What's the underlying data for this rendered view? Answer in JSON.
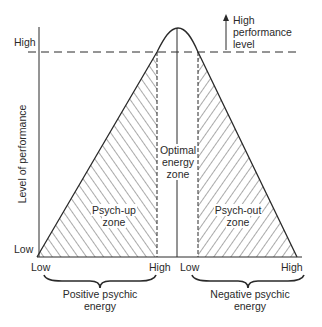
{
  "diagram": {
    "y_axis": {
      "title": "Level of performance",
      "high_label": "High",
      "low_label": "Low"
    },
    "performance_marker": {
      "label_line1": "High",
      "label_line2": "performance",
      "label_line3": "level"
    },
    "zones": {
      "psych_up": {
        "line1": "Psych-up",
        "line2": "zone"
      },
      "optimal": {
        "line1": "Optimal",
        "line2": "energy",
        "line3": "zone"
      },
      "psych_out": {
        "line1": "Psych-out",
        "line2": "zone"
      }
    },
    "x_axis": {
      "positive": {
        "low": "Low",
        "high": "High",
        "title_line1": "Positive psychic",
        "title_line2": "energy"
      },
      "negative": {
        "low": "Low",
        "high": "High",
        "title_line1": "Negative psychic",
        "title_line2": "energy"
      }
    },
    "colors": {
      "ink": "#2a2a2a",
      "background": "#ffffff"
    }
  }
}
